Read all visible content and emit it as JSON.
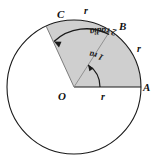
{
  "figure": {
    "type": "geometry-diagram",
    "colors": {
      "stroke": "#1a1a1a",
      "sector_fill": "#cfcfcf",
      "background": "#ffffff",
      "radius_line": "#8a8a8a"
    },
    "circle": {
      "center_x": 74,
      "center_y": 87,
      "radius": 67
    },
    "points": [
      {
        "id": "O",
        "label": "O",
        "role": "center",
        "angle_rad": null,
        "label_x": 58,
        "label_y": 91
      },
      {
        "id": "A",
        "label": "A",
        "role": "on-circle",
        "angle_rad": 0,
        "label_x": 143,
        "label_y": 82
      },
      {
        "id": "B",
        "label": "B",
        "role": "on-circle",
        "angle_rad": 1,
        "label_x": 119,
        "label_y": 21
      },
      {
        "id": "C",
        "label": "C",
        "role": "on-circle",
        "angle_rad": 2,
        "label_x": 57,
        "label_y": 9
      }
    ],
    "radius_labels": [
      {
        "id": "r-bottom",
        "label": "r",
        "x": 101,
        "y": 92
      },
      {
        "id": "r-top",
        "label": "r",
        "x": 84,
        "y": 6
      },
      {
        "id": "r-arc-right",
        "label": "r",
        "x": 137,
        "y": 44
      },
      {
        "id": "r-radius-ob",
        "label": "r",
        "x": 112,
        "y": 9
      }
    ],
    "angle_arcs": [
      {
        "id": "outer-angle",
        "label": "2 radians",
        "measure": 2,
        "unit": "radians",
        "arc_radius": 48,
        "from_angle_rad": 0,
        "to_angle_rad": 2,
        "arrow_at": "end"
      },
      {
        "id": "inner-angle",
        "label": "1 rad",
        "measure": 1,
        "unit": "rad",
        "arc_radius": 26,
        "from_angle_rad": 0,
        "to_angle_rad": 1,
        "arrow_at": "end"
      }
    ],
    "sector": {
      "id": "shaded-sector",
      "from_angle_rad": 0,
      "to_angle_rad": 2,
      "fill": "#cfcfcf"
    }
  }
}
